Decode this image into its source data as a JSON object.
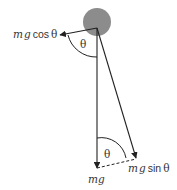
{
  "diagram": {
    "bob_color": "#8c8c8c",
    "line_color": "#222222",
    "labels": {
      "mg_cos": {
        "m": "m",
        "g": "g",
        "fn": "cos",
        "theta": "θ"
      },
      "mg_sin": {
        "m": "m",
        "g": "g",
        "fn": "sin",
        "theta": "θ"
      },
      "mg": "mg",
      "theta_top": "θ",
      "theta_bottom": "θ"
    }
  }
}
